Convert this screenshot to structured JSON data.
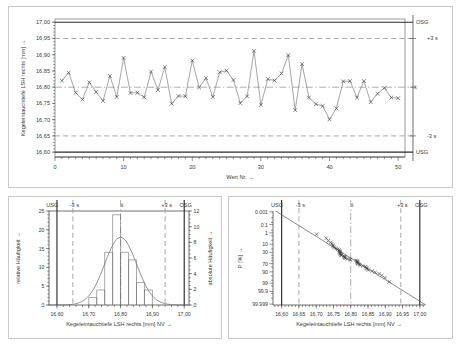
{
  "chart_data": [
    {
      "type": "line",
      "name": "run-chart",
      "title": "",
      "xlabel": "Wert Nr. →",
      "ylabel": "Kegeleintauchtiefe LSH rechts [mm] →",
      "xlim": [
        0,
        51
      ],
      "ylim": [
        16.585,
        17.01
      ],
      "xticks": [
        0,
        10,
        20,
        30,
        40,
        50
      ],
      "xticklabels": [
        "0",
        "10",
        "20",
        "30",
        "40",
        "50"
      ],
      "yticks": [
        16.6,
        16.65,
        16.7,
        16.75,
        16.8,
        16.85,
        16.9,
        16.95,
        17.0
      ],
      "yticklabels": [
        "16,60",
        "16,65",
        "16,70",
        "16,75",
        "16,80",
        "16,85",
        "16,90",
        "16,95",
        "17,00"
      ],
      "grid": false,
      "marker": "x",
      "reference_lines": [
        {
          "label": "OSG",
          "value": 17.0,
          "style": "solid"
        },
        {
          "label": "+3 s",
          "value": 16.95,
          "style": "dashed"
        },
        {
          "label": "x̄",
          "value": 16.8,
          "style": "dashdot"
        },
        {
          "label": "-3 s",
          "value": 16.65,
          "style": "dashed"
        },
        {
          "label": "USG",
          "value": 16.6,
          "style": "solid"
        }
      ],
      "x": [
        1,
        2,
        3,
        4,
        5,
        6,
        7,
        8,
        9,
        10,
        11,
        12,
        13,
        14,
        15,
        16,
        17,
        18,
        19,
        20,
        21,
        22,
        23,
        24,
        25,
        26,
        27,
        28,
        29,
        30,
        31,
        32,
        33,
        34,
        35,
        36,
        37,
        38,
        39,
        40,
        41,
        42,
        43,
        44,
        45,
        46,
        47,
        48,
        49,
        50
      ],
      "values": [
        16.82,
        16.845,
        16.783,
        16.762,
        16.815,
        16.785,
        16.758,
        16.835,
        16.77,
        16.89,
        16.782,
        16.783,
        16.769,
        16.848,
        16.791,
        16.862,
        16.749,
        16.773,
        16.772,
        16.882,
        16.799,
        16.828,
        16.77,
        16.846,
        16.851,
        16.822,
        16.751,
        16.772,
        16.912,
        16.745,
        16.825,
        16.82,
        16.842,
        16.899,
        16.729,
        16.871,
        16.768,
        16.748,
        16.742,
        16.701,
        16.735,
        16.818,
        16.819,
        16.768,
        16.819,
        16.754,
        16.78,
        16.798,
        16.768,
        16.766
      ]
    },
    {
      "type": "bar",
      "name": "histogram",
      "title": "",
      "xlabel": "Kegeleintauchtiefe LSH rechts [mm]  NV →",
      "ylabel": "relative Häufigkeit →",
      "ylabel_right": "absolute Häufigkeit →",
      "xlim": [
        16.575,
        17.015
      ],
      "ylim": [
        0,
        25
      ],
      "ylim_right": [
        0,
        12
      ],
      "xticks": [
        16.6,
        16.7,
        16.8,
        16.9,
        17.0
      ],
      "xticklabels": [
        "16,60",
        "16,70",
        "16,80",
        "16,90",
        "17,00"
      ],
      "yticks": [
        0,
        5,
        10,
        15,
        20,
        25
      ],
      "yticklabels": [
        "0",
        "5",
        "10",
        "15",
        "20",
        "25"
      ],
      "yticks_right": [
        0,
        2,
        4,
        6,
        8,
        10,
        12
      ],
      "yticklabels_right": [
        "0",
        "2",
        "4",
        "6",
        "8",
        "10",
        "12"
      ],
      "grid": false,
      "bin_width": 0.025,
      "bin_starts": [
        16.7,
        16.725,
        16.75,
        16.775,
        16.8,
        16.825,
        16.85,
        16.875
      ],
      "values_absolute": [
        1,
        2,
        7,
        12,
        7,
        6,
        3,
        2
      ],
      "values_relative": [
        2,
        4,
        14,
        24,
        14,
        12,
        6,
        4
      ],
      "normal_curve": {
        "mean": 16.8,
        "sigma": 0.05,
        "peak_relative": 18
      },
      "reference_lines": [
        {
          "label": "USG",
          "value": 16.6,
          "style": "solid"
        },
        {
          "label": "-3 s",
          "value": 16.65,
          "style": "dashed"
        },
        {
          "label": "x̄",
          "value": 16.8,
          "style": "dashdot"
        },
        {
          "label": "+3 s",
          "value": 16.94,
          "style": "dashed"
        },
        {
          "label": "OSG",
          "value": 17.0,
          "style": "solid"
        }
      ]
    },
    {
      "type": "scatter",
      "name": "probability-plot",
      "title": "",
      "xlabel": "Kegeleintauchtiefe LSH rechts [mm]  NV →",
      "ylabel": "P [%] →",
      "xlim": [
        16.575,
        17.015
      ],
      "xticks": [
        16.6,
        16.65,
        16.7,
        16.75,
        16.8,
        16.85,
        16.9,
        16.95,
        17.0
      ],
      "xticklabels": [
        "16,60",
        "16,65",
        "16,70",
        "16,75",
        "16,80",
        "16,85",
        "16,90",
        "16,95",
        "17,00"
      ],
      "yticklabels": [
        "99.999",
        "99.9",
        "99",
        "90",
        "70",
        "30",
        "10",
        "1",
        "0.1",
        "0.001"
      ],
      "yticks_probability": [
        99.999,
        99.9,
        99,
        90,
        70,
        30,
        10,
        1,
        0.1,
        0.001
      ],
      "grid": false,
      "marker": "x",
      "fit_line": {
        "mean": 16.8,
        "sigma": 0.05
      },
      "reference_lines": [
        {
          "label": "USG",
          "value": 16.6,
          "style": "solid"
        },
        {
          "label": "-3 s",
          "value": 16.65,
          "style": "dashed"
        },
        {
          "label": "x̄",
          "value": 16.8,
          "style": "dashdot"
        },
        {
          "label": "+3 s",
          "value": 16.945,
          "style": "dashed"
        },
        {
          "label": "OSG",
          "value": 17.0,
          "style": "solid"
        }
      ],
      "points_x": [
        16.701,
        16.729,
        16.735,
        16.742,
        16.745,
        16.748,
        16.749,
        16.751,
        16.754,
        16.758,
        16.762,
        16.766,
        16.768,
        16.768,
        16.768,
        16.769,
        16.77,
        16.77,
        16.772,
        16.772,
        16.773,
        16.78,
        16.782,
        16.783,
        16.783,
        16.785,
        16.791,
        16.798,
        16.799,
        16.815,
        16.818,
        16.819,
        16.819,
        16.82,
        16.82,
        16.822,
        16.825,
        16.828,
        16.835,
        16.842,
        16.845,
        16.846,
        16.848,
        16.851,
        16.862,
        16.871,
        16.882,
        16.89,
        16.899,
        16.912
      ]
    }
  ]
}
